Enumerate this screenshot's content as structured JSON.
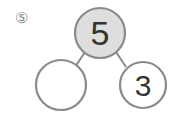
{
  "problem": {
    "label": "⑤",
    "whole": "5",
    "part_left": "",
    "part_right": "3"
  },
  "colors": {
    "circle_stroke": "#8a8a8a",
    "whole_fill": "#dedede",
    "part_fill": "#ffffff",
    "text": "#333333"
  }
}
